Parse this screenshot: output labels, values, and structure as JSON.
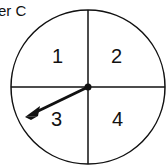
{
  "title": "er C",
  "spinner": {
    "sections": [
      {
        "label": "1",
        "position": "top-left"
      },
      {
        "label": "2",
        "position": "top-right"
      },
      {
        "label": "3",
        "position": "bottom-left"
      },
      {
        "label": "4",
        "position": "bottom-right"
      }
    ],
    "pointer_section": "3",
    "colors": {
      "stroke": "#111111",
      "background": "#ffffff"
    }
  }
}
